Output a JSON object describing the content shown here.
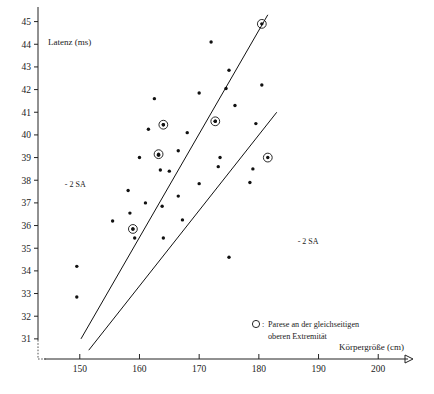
{
  "chart_data": {
    "type": "scatter",
    "title": "",
    "xlabel": "Körpergröße (cm)",
    "ylabel": "Latenz (ms)",
    "xlim": [
      143,
      207
    ],
    "ylim": [
      30.2,
      45.6
    ],
    "grid": false,
    "legend_position": "bottom-right",
    "xticks": [
      150,
      160,
      170,
      180,
      190,
      200
    ],
    "yticks": [
      31,
      32,
      33,
      34,
      35,
      36,
      37,
      38,
      39,
      40,
      41,
      42,
      43,
      44,
      45
    ],
    "legend": [
      {
        "marker": "open-circle",
        "line1": "Parese an der gleichseitigen",
        "line2": "oberen Extremität"
      }
    ],
    "annotations": [
      {
        "text": "- 2 SA",
        "x": 147.5,
        "y": 37.7
      },
      {
        "text": "- 2 SA",
        "x": 186.5,
        "y": 35.2
      }
    ],
    "reference_lines": [
      {
        "name": "upper-2sa-line",
        "x": [
          150.2,
          181.5
        ],
        "y": [
          31.0,
          45.3
        ]
      },
      {
        "name": "lower-2sa-line",
        "x": [
          151.5,
          183.0
        ],
        "y": [
          30.5,
          41.0
        ]
      }
    ],
    "series": [
      {
        "name": "Patienten ohne Parese",
        "marker": "filled-dot",
        "points": [
          [
            149.5,
            32.85
          ],
          [
            149.5,
            34.2
          ],
          [
            155.5,
            36.2
          ],
          [
            158.4,
            36.55
          ],
          [
            158.9,
            35.85
          ],
          [
            159.2,
            35.45
          ],
          [
            164.0,
            35.45
          ],
          [
            167.2,
            36.25
          ],
          [
            175.0,
            34.6
          ],
          [
            158.1,
            37.55
          ],
          [
            161.0,
            37.0
          ],
          [
            163.8,
            36.85
          ],
          [
            166.5,
            37.3
          ],
          [
            165.0,
            38.4
          ],
          [
            163.5,
            38.45
          ],
          [
            170.0,
            37.85
          ],
          [
            173.2,
            38.6
          ],
          [
            178.5,
            37.9
          ],
          [
            179.0,
            38.5
          ],
          [
            160.0,
            39.0
          ],
          [
            163.2,
            39.1
          ],
          [
            166.5,
            39.3
          ],
          [
            173.5,
            39.0
          ],
          [
            161.5,
            40.25
          ],
          [
            164.0,
            40.45
          ],
          [
            168.0,
            40.1
          ],
          [
            172.7,
            40.6
          ],
          [
            176.0,
            41.3
          ],
          [
            162.5,
            41.6
          ],
          [
            170.0,
            41.85
          ],
          [
            174.5,
            42.05
          ],
          [
            180.5,
            42.2
          ],
          [
            175.0,
            42.85
          ],
          [
            172.0,
            44.1
          ],
          [
            179.5,
            40.5
          ]
        ]
      },
      {
        "name": "Parese an der gleichseitigen oberen Extremität",
        "marker": "dot-in-circle",
        "points": [
          [
            158.9,
            35.85
          ],
          [
            163.2,
            39.15
          ],
          [
            164.0,
            40.45
          ],
          [
            172.7,
            40.6
          ],
          [
            181.5,
            39.0
          ],
          [
            180.5,
            44.9
          ]
        ]
      }
    ]
  }
}
